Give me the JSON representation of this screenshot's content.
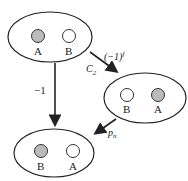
{
  "diagram": {
    "states": [
      {
        "id": "top",
        "particles": [
          {
            "label": "A",
            "shaded": true
          },
          {
            "label": "B",
            "shaded": false
          }
        ]
      },
      {
        "id": "right",
        "particles": [
          {
            "label": "B",
            "shaded": false
          },
          {
            "label": "A",
            "shaded": true
          }
        ]
      },
      {
        "id": "bottom",
        "particles": [
          {
            "label": "B",
            "shaded": true
          },
          {
            "label": "A",
            "shaded": false
          }
        ]
      }
    ],
    "arrows": [
      {
        "from": "top",
        "to": "right",
        "label_operator": "C",
        "label_operator_sub": "2",
        "label_factor": "(−1)",
        "label_factor_sup": "f"
      },
      {
        "from": "top",
        "to": "bottom",
        "label": "−1"
      },
      {
        "from": "right",
        "to": "bottom",
        "label": "p",
        "label_sub": "n"
      }
    ],
    "colors": {
      "shaded": "#bbbbbb",
      "line": "#222222"
    }
  }
}
